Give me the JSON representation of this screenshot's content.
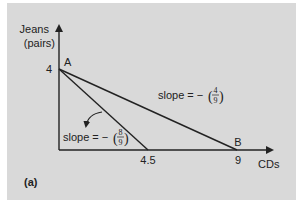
{
  "figure": {
    "panel_label": "(a)",
    "y_axis_label_line1": "Jeans",
    "y_axis_label_line2": "(pairs)",
    "x_axis_label": "CDs",
    "y_tick": "4",
    "x_ticks": [
      "4.5",
      "9"
    ],
    "point_labels": {
      "a": "A",
      "b": "B"
    },
    "slope_labels": [
      {
        "prefix": "slope = −",
        "numerator": "4",
        "denominator": "9"
      },
      {
        "prefix": "slope = −",
        "numerator": "8",
        "denominator": "9"
      }
    ],
    "colors": {
      "background": "#d9d9d9",
      "ink": "#222222"
    }
  },
  "chart_data": {
    "type": "line",
    "title": "",
    "xlabel": "CDs",
    "ylabel": "Jeans (pairs)",
    "xlim": [
      0,
      10
    ],
    "ylim": [
      0,
      5
    ],
    "series": [
      {
        "name": "budget line A-B",
        "points": [
          [
            0,
            4
          ],
          [
            9,
            0
          ]
        ],
        "slope": "-(4/9)"
      },
      {
        "name": "budget line after price change",
        "points": [
          [
            0,
            4
          ],
          [
            4.5,
            0
          ]
        ],
        "slope": "-(8/9)"
      }
    ],
    "annotations": [
      {
        "text": "A",
        "at": [
          0,
          4
        ]
      },
      {
        "text": "B",
        "at": [
          9,
          0
        ]
      },
      {
        "text": "slope = -(4/9)",
        "refers_to": "budget line A-B"
      },
      {
        "text": "slope = -(8/9)",
        "refers_to": "budget line after price change",
        "arrow": "curved arrow indicating rotation"
      }
    ]
  }
}
